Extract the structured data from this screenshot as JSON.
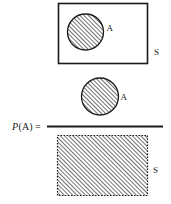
{
  "figure": {
    "formula": {
      "prefix_italic": "P",
      "prefix_rest": "(A) =",
      "full_text": "P(A) ="
    },
    "top_diagram": {
      "rect_label": "S",
      "circle_label": "A"
    },
    "numerator": {
      "circle_label": "A"
    },
    "denominator": {
      "rect_label": "S"
    }
  },
  "colors": {
    "stroke": "#1a1a1a",
    "hatch": "#333333",
    "background": "#ffffff",
    "fill": "#ffffff"
  }
}
